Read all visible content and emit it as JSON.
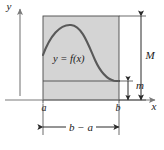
{
  "figure": {
    "axes": {
      "y_label": "y",
      "x_label": "x"
    },
    "ticks": {
      "left_label": "a",
      "right_label": "b"
    },
    "curve": {
      "label": "y = f(x)"
    },
    "dimensions": {
      "max_label": "M",
      "min_label": "m",
      "width_label": "b − a"
    },
    "colors": {
      "region_fill": "#d4d4d4",
      "region_stroke": "#4a4a4a",
      "curve_stroke": "#595959",
      "axis_stroke": "#7a7a7a",
      "dimension_stroke": "#2b2b2b",
      "text": "#1a1a1a",
      "background": "#ffffff"
    },
    "geometry": {
      "rect_left": 43,
      "rect_right": 119,
      "rect_top": 16,
      "rect_bottom": 100,
      "min_line_y": 81,
      "axis_y": 100,
      "axis_x": 20,
      "max_dim_x": 141,
      "min_dim_x": 128,
      "width_dim_y": 127
    }
  }
}
